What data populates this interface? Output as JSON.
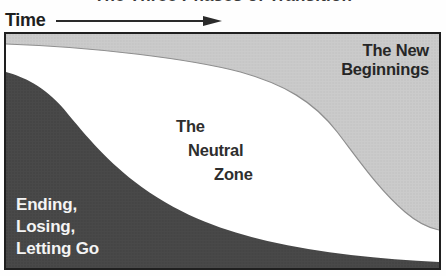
{
  "title": "The Three Phases of Transition",
  "time_axis": {
    "label": "Time"
  },
  "diagram": {
    "border_color": "#1f1f1f",
    "curve_line_color": "#8e8e8e",
    "phases": [
      {
        "name": "Ending, Losing, Letting Go",
        "label_lines": [
          "Ending,",
          "Losing,",
          "Letting Go"
        ],
        "fill": "#494949",
        "text_color": "#f4f4f4",
        "position": "bottom-left"
      },
      {
        "name": "The Neutral Zone",
        "label_lines": [
          "The",
          "Neutral",
          "Zone"
        ],
        "fill": "#ffffff",
        "text_color": "#2e2e2e",
        "position": "center"
      },
      {
        "name": "The New Beginnings",
        "label_lines": [
          "The New",
          "Beginnings"
        ],
        "fill": "#cbcbcb",
        "text_color": "#262626",
        "position": "top-right"
      }
    ]
  }
}
